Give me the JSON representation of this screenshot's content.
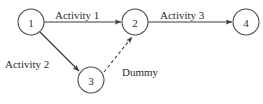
{
  "diagram": {
    "type": "activity-on-arrow-network",
    "background_color": "#ffffff",
    "stroke_color": "#3d3d3d",
    "text_color": "#2b2b2b",
    "nodes": [
      {
        "id": "1",
        "label": "1",
        "cx": 31,
        "cy": 22,
        "r": 13
      },
      {
        "id": "2",
        "label": "2",
        "cx": 135,
        "cy": 22,
        "r": 13
      },
      {
        "id": "3",
        "label": "3",
        "cx": 91,
        "cy": 80,
        "r": 13
      },
      {
        "id": "4",
        "label": "4",
        "cx": 246,
        "cy": 22,
        "r": 13
      }
    ],
    "edges": [
      {
        "id": "activity-1",
        "label": "Activity 1",
        "from": "1",
        "to": "2",
        "style": "solid",
        "arrow": true,
        "x1": 44,
        "y1": 22,
        "x2": 121,
        "y2": 22,
        "label_x": 55,
        "label_y": 19
      },
      {
        "id": "activity-3",
        "label": "Activity 3",
        "from": "2",
        "to": "4",
        "style": "solid",
        "arrow": true,
        "x1": 148,
        "y1": 22,
        "x2": 232,
        "y2": 22,
        "label_x": 160,
        "label_y": 19
      },
      {
        "id": "activity-2",
        "label": "Activity 2",
        "from": "1",
        "to": "3",
        "style": "solid",
        "arrow": true,
        "x1": 40,
        "y1": 32,
        "x2": 79,
        "y2": 71,
        "label_x": 5,
        "label_y": 68
      },
      {
        "id": "dummy",
        "label": "Dummy",
        "from": "3",
        "to": "2",
        "style": "dashed",
        "arrow": true,
        "x1": 104,
        "y1": 72,
        "x2": 132,
        "y2": 37,
        "label_x": 122,
        "label_y": 76
      }
    ]
  }
}
